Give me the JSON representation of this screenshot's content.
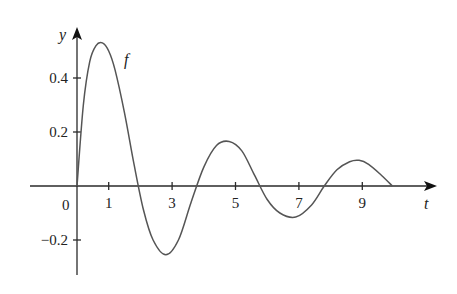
{
  "chart_data": {
    "type": "line",
    "title": "",
    "xlabel": "t",
    "ylabel": "y",
    "curve_label": "f",
    "origin_label": "0",
    "x_ticks": [
      1,
      3,
      5,
      7,
      9
    ],
    "x_tick_labels": [
      "1",
      "3",
      "5",
      "7",
      "9"
    ],
    "y_ticks": [
      0.4,
      0.2,
      -0.2
    ],
    "y_tick_labels": [
      "0.4",
      "0.2",
      "−0.2"
    ],
    "xlim": [
      -0.6,
      11.2
    ],
    "ylim": [
      -0.3,
      0.58
    ],
    "grid": false,
    "legend": "none (curve labeled 'f' inline)",
    "series": [
      {
        "name": "f",
        "x": [
          0,
          0.2,
          0.4,
          0.6,
          0.8,
          1.0,
          1.2,
          1.5,
          1.8,
          2.1,
          2.4,
          2.8,
          3.2,
          3.6,
          4.0,
          4.4,
          4.8,
          5.2,
          5.6,
          6.0,
          6.4,
          6.9,
          7.4,
          7.8,
          8.2,
          8.6,
          8.9,
          9.2,
          9.6,
          9.95
        ],
        "values": [
          0,
          0.3,
          0.46,
          0.52,
          0.53,
          0.5,
          0.43,
          0.27,
          0.08,
          -0.09,
          -0.2,
          -0.255,
          -0.2,
          -0.06,
          0.07,
          0.15,
          0.165,
          0.13,
          0.04,
          -0.05,
          -0.1,
          -0.115,
          -0.07,
          0.0,
          0.06,
          0.09,
          0.095,
          0.08,
          0.04,
          0.0
        ]
      }
    ]
  }
}
